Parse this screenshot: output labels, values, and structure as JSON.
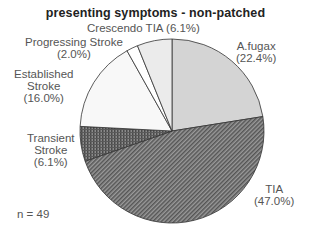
{
  "chart_data": {
    "type": "pie",
    "title": "presenting symptoms - non-patched",
    "annotation": "n = 49",
    "start_angle": "12 o'clock, clockwise",
    "slices": [
      {
        "label": "A.fugax",
        "value": 22.4,
        "pct_text": "(22.4%)",
        "fill": "#d4d4d4",
        "pattern": "light-gray"
      },
      {
        "label": "TIA",
        "value": 47.0,
        "pct_text": "(47.0%)",
        "fill": "#7a7a7a",
        "pattern": "diagonal-hatch"
      },
      {
        "label": "Transient Stroke",
        "value": 6.1,
        "pct_text": "(6.1%)",
        "fill": "#686868",
        "pattern": "cross-hatch"
      },
      {
        "label": "Established Stroke",
        "value": 16.0,
        "pct_text": "(16.0%)",
        "fill": "#f8f8f8",
        "pattern": "near-white"
      },
      {
        "label": "Progressing Stroke",
        "value": 2.0,
        "pct_text": "(2.0%)",
        "fill": "#ffffff",
        "pattern": "white"
      },
      {
        "label": "Crescendo TIA",
        "value": 6.1,
        "pct_text": "(6.1%)",
        "fill": "#ebebeb",
        "pattern": "very-light-gray"
      }
    ]
  },
  "labels": {
    "afugax": {
      "line1": "A.fugax",
      "line2": "(22.4%)"
    },
    "tia": {
      "line1": "TIA",
      "line2": "(47.0%)"
    },
    "transient": {
      "line1": "Transient",
      "line2": "Stroke",
      "line3": "(6.1%)"
    },
    "established": {
      "line1": "Established",
      "line2": "Stroke",
      "line3": "(16.0%)"
    },
    "progressing": {
      "line1": "Progressing Stroke",
      "line2": "(2.0%)"
    },
    "crescendo": {
      "line1": "Crescendo TIA (6.1%)"
    }
  }
}
